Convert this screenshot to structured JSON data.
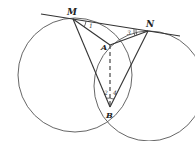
{
  "diagram": {
    "type": "geometry",
    "points": {
      "M": {
        "label": "M",
        "x": 73,
        "y": 19
      },
      "N": {
        "label": "N",
        "x": 148,
        "y": 31
      },
      "A": {
        "label": "A",
        "x": 110,
        "y": 45
      },
      "B": {
        "label": "B",
        "x": 110,
        "y": 107
      }
    },
    "angle_labels": {
      "a1": "1",
      "a2": "2",
      "a3": "3",
      "a4": "4"
    },
    "circles": [
      {
        "name": "left-circle",
        "cx": 75,
        "cy": 75,
        "r": 57
      },
      {
        "name": "right-circle",
        "cx": 149,
        "cy": 86,
        "r": 55
      }
    ],
    "colors": {
      "stroke": "#333333",
      "circle_stroke": "#555555"
    }
  }
}
